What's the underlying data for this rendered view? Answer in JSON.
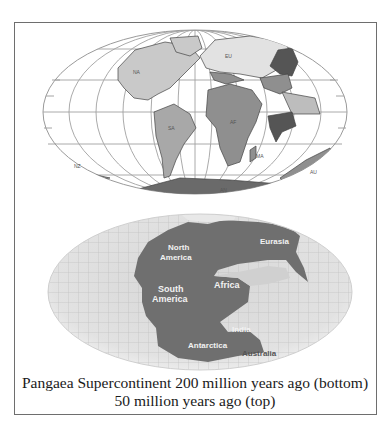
{
  "figure": {
    "caption_line1": "Pangaea Supercontinent 200 million years ago (bottom)",
    "caption_line2": "50 million years ago (top)"
  },
  "top_map": {
    "description": "World map 50 million years ago (Mollweide projection, graticule)",
    "labels": {
      "north_america": "NA",
      "eurasia": "EU",
      "south_america": "SA",
      "africa": "AF",
      "india": "IN",
      "australia": "AU",
      "antarctica": "AN",
      "new_zealand": "NZ",
      "madagascar": "MA"
    },
    "colors": {
      "ocean": "#ffffff",
      "grid": "#9a9a9a",
      "land_light": "#c9c9c9",
      "land_mid": "#8f8f8f",
      "land_dark": "#5a5a5a"
    }
  },
  "bottom_map": {
    "description": "Pangaea supercontinent 200 million years ago",
    "labels": {
      "north_america_1": "North",
      "north_america_2": "America",
      "eurasia": "Eurasia",
      "south_america_1": "South",
      "south_america_2": "America",
      "africa": "Africa",
      "india": "India",
      "antarctica": "Antarctica",
      "australia": "Australia"
    },
    "colors": {
      "ocean": "#dcdcdc",
      "grid": "#b5b5b5",
      "land": "#6f6f6f"
    }
  }
}
